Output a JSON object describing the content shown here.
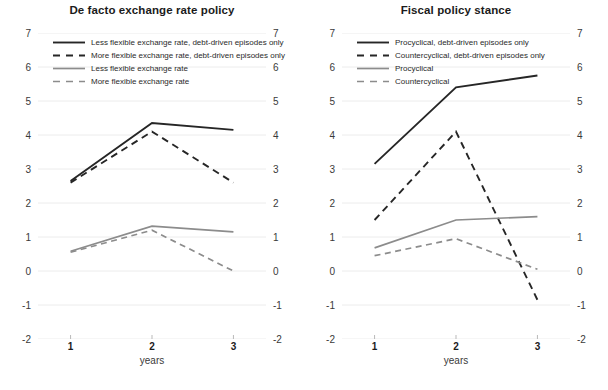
{
  "figure": {
    "xlabel": "years",
    "colors": {
      "dark": "#262626",
      "grey": "#8c8c8c",
      "grid": "#ececec",
      "text": "#231f20"
    }
  },
  "chart_data": [
    {
      "type": "line",
      "title": "De facto exchange rate policy",
      "xlabel": "years",
      "ylabel": "",
      "x": [
        1,
        2,
        3
      ],
      "xticklabels": [
        "1",
        "2",
        "3"
      ],
      "yticks": [
        -2,
        -1,
        0,
        1,
        2,
        3,
        4,
        5,
        6,
        7
      ],
      "yticklabels": [
        "-2",
        "-1",
        "0",
        "1",
        "2",
        "3",
        "4",
        "5",
        "6",
        "7"
      ],
      "ylim": [
        -2,
        7
      ],
      "xlim": [
        0.6,
        3.4
      ],
      "grid": true,
      "legend_position": "upper left",
      "series": [
        {
          "name": "Less flexible exchange rate, debt-driven episodes only",
          "values": [
            2.65,
            4.35,
            4.15
          ],
          "color": "#262626",
          "style": "solid",
          "width": 1.9
        },
        {
          "name": "More flexible exchange rate, debt-driven episodes only",
          "values": [
            2.6,
            4.1,
            2.6
          ],
          "color": "#262626",
          "style": "dashed",
          "width": 1.9
        },
        {
          "name": "Less flexible exchange rate",
          "values": [
            0.58,
            1.32,
            1.15
          ],
          "color": "#8c8c8c",
          "style": "solid",
          "width": 1.7
        },
        {
          "name": "More flexible exchange rate",
          "values": [
            0.55,
            1.2,
            0.0
          ],
          "color": "#8c8c8c",
          "style": "dashed",
          "width": 1.7
        }
      ]
    },
    {
      "type": "line",
      "title": "Fiscal policy stance",
      "xlabel": "years",
      "ylabel": "",
      "x": [
        1,
        2,
        3
      ],
      "xticklabels": [
        "1",
        "2",
        "3"
      ],
      "yticks": [
        -2,
        -1,
        0,
        1,
        2,
        3,
        4,
        5,
        6,
        7
      ],
      "yticklabels": [
        "-2",
        "-1",
        "0",
        "1",
        "2",
        "3",
        "4",
        "5",
        "6",
        "7"
      ],
      "ylim": [
        -2,
        7
      ],
      "xlim": [
        0.6,
        3.4
      ],
      "grid": true,
      "legend_position": "upper left",
      "series": [
        {
          "name": "Procyclical, debt-driven episodes only",
          "values": [
            3.15,
            5.4,
            5.75
          ],
          "color": "#262626",
          "style": "solid",
          "width": 1.9
        },
        {
          "name": "Countercyclical, debt-driven episodes only",
          "values": [
            1.5,
            4.1,
            -0.85
          ],
          "color": "#262626",
          "style": "dashed",
          "width": 1.9
        },
        {
          "name": "Procyclical",
          "values": [
            0.68,
            1.5,
            1.6
          ],
          "color": "#8c8c8c",
          "style": "solid",
          "width": 1.7
        },
        {
          "name": "Countercyclical",
          "values": [
            0.45,
            0.95,
            0.05
          ],
          "color": "#8c8c8c",
          "style": "dashed",
          "width": 1.7
        }
      ]
    }
  ]
}
